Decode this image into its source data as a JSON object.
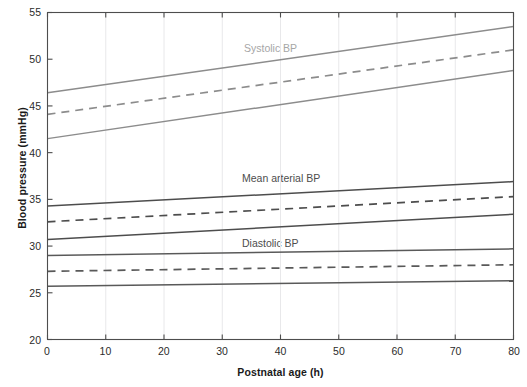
{
  "chart_data": {
    "type": "line",
    "title": "",
    "xlabel": "Postnatal age (h)",
    "ylabel": "Blood pressure (mmHg)",
    "xlim": [
      0,
      80
    ],
    "ylim": [
      20,
      55
    ],
    "xticks": [
      0,
      10,
      20,
      30,
      40,
      50,
      60,
      70,
      80
    ],
    "yticks": [
      20,
      25,
      30,
      35,
      40,
      45,
      50,
      55
    ],
    "grid": "vertical-faint",
    "legend": "inline-annotations",
    "x": [
      0,
      80
    ],
    "annotations": [
      {
        "text": "Systolic BP",
        "x": 32,
        "y": 50.4,
        "color": "#a6a6a6"
      },
      {
        "text": "Mean arterial BP",
        "x": 31,
        "y": 37.6,
        "color": "#4d4d4d"
      },
      {
        "text": "Diastolic BP",
        "x": 31,
        "y": 30.6,
        "color": "#4d4d4d"
      }
    ],
    "series": [
      {
        "name": "Systolic BP 90th centile",
        "group": "Systolic BP",
        "style": "solid",
        "color": "#8c8c8c",
        "values": [
          46.4,
          53.5
        ]
      },
      {
        "name": "Systolic BP 50th centile",
        "group": "Systolic BP",
        "style": "dashed",
        "color": "#8c8c8c",
        "values": [
          44.1,
          51.0
        ]
      },
      {
        "name": "Systolic BP 10th centile",
        "group": "Systolic BP",
        "style": "solid",
        "color": "#8c8c8c",
        "values": [
          41.5,
          48.8
        ]
      },
      {
        "name": "Mean arterial BP 90th centile",
        "group": "Mean arterial BP",
        "style": "solid",
        "color": "#4d4d4d",
        "values": [
          34.3,
          36.9
        ]
      },
      {
        "name": "Mean arterial BP 50th centile",
        "group": "Mean arterial BP",
        "style": "dashed",
        "color": "#4d4d4d",
        "values": [
          32.6,
          35.3
        ]
      },
      {
        "name": "Mean arterial BP 10th centile",
        "group": "Mean arterial BP",
        "style": "solid",
        "color": "#4d4d4d",
        "values": [
          30.7,
          33.4
        ]
      },
      {
        "name": "Diastolic BP 90th centile",
        "group": "Diastolic BP",
        "style": "solid",
        "color": "#595959",
        "values": [
          29.0,
          29.7
        ]
      },
      {
        "name": "Diastolic BP 50th centile",
        "group": "Diastolic BP",
        "style": "dashed",
        "color": "#595959",
        "values": [
          27.3,
          28.0
        ]
      },
      {
        "name": "Diastolic BP 10th centile",
        "group": "Diastolic BP",
        "style": "solid",
        "color": "#595959",
        "values": [
          25.7,
          26.3
        ]
      }
    ]
  },
  "axes": {
    "y_title": "Blood pressure (mmHg)",
    "x_title": "Postnatal age (h)",
    "y_tick_labels": [
      "55",
      "50",
      "45",
      "40",
      "35",
      "30",
      "25",
      "20"
    ],
    "x_tick_labels": [
      "0",
      "10",
      "20",
      "30",
      "40",
      "50",
      "60",
      "70",
      "80"
    ]
  },
  "annotations": {
    "systolic": "Systolic BP",
    "mean_arterial": "Mean arterial BP",
    "diastolic": "Diastolic BP"
  },
  "colors": {
    "systolic": "#8c8c8c",
    "mean_arterial": "#4d4d4d",
    "diastolic": "#595959",
    "axis": "#4d4d4d",
    "grid": "#e8e8ea"
  }
}
